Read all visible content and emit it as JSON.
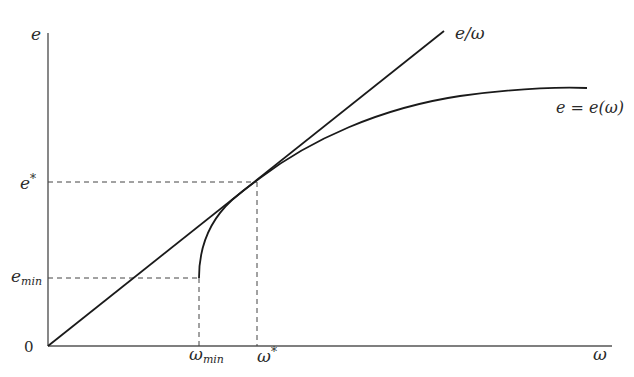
{
  "diagram": {
    "axes": {
      "y_label": "e",
      "x_label": "ω",
      "origin_label": "0"
    },
    "ray": {
      "label_main": "e/ω",
      "description": "ray from origin"
    },
    "curve": {
      "label": "e = e(ω)"
    },
    "y_ticks": [
      {
        "base": "e",
        "sup": "*",
        "sub": ""
      },
      {
        "base": "e",
        "sup": "",
        "sub": "min"
      }
    ],
    "x_ticks": [
      {
        "base": "ω",
        "sup": "",
        "sub": "min"
      },
      {
        "base": "ω",
        "sup": "*",
        "sub": ""
      }
    ],
    "colors": {
      "line": "#1a1a1a",
      "axis": "#555555",
      "dashed": "#444444",
      "text": "#2a2a2a"
    }
  }
}
